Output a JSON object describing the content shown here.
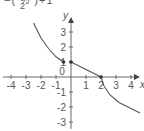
{
  "header_fragment": {
    "line1": "−( ½ )+1",
    "line2": "2"
  },
  "chart_data": {
    "type": "line",
    "title": "",
    "xlabel": "x",
    "ylabel": "y",
    "xlim": [
      -4.5,
      4.7
    ],
    "ylim": [
      -3.3,
      3.9
    ],
    "x_ticks": [
      -4,
      -3,
      -2,
      -1,
      0,
      1,
      2,
      3,
      4
    ],
    "x_tick_labels": [
      "-4",
      "-3",
      "-2",
      "-1",
      "0",
      "1",
      "2",
      "3",
      "4"
    ],
    "y_ticks": [
      -3,
      -2,
      -1,
      1,
      2,
      3
    ],
    "y_tick_labels": [
      "-3",
      "-2",
      "-1",
      "1",
      "2",
      "3"
    ],
    "grid": false,
    "legend": null,
    "series": [
      {
        "name": "left-curve",
        "kind": "curve",
        "points": [
          [
            -2.5,
            3.6
          ],
          [
            -2.0,
            2.6
          ],
          [
            -1.5,
            1.9
          ],
          [
            -1.0,
            1.35
          ],
          [
            -0.5,
            1.0
          ]
        ]
      },
      {
        "name": "middle-segment",
        "kind": "line",
        "points": [
          [
            0,
            1
          ],
          [
            2,
            0
          ]
        ]
      },
      {
        "name": "right-curve",
        "kind": "curve",
        "points": [
          [
            2.0,
            0.0
          ],
          [
            2.2,
            -0.6
          ],
          [
            2.6,
            -1.2
          ],
          [
            3.2,
            -1.7
          ],
          [
            4.0,
            -2.1
          ],
          [
            4.6,
            -2.4
          ]
        ]
      }
    ],
    "marked_points": [
      [
        -0.5,
        1
      ],
      [
        0,
        1
      ],
      [
        2,
        0
      ]
    ]
  }
}
